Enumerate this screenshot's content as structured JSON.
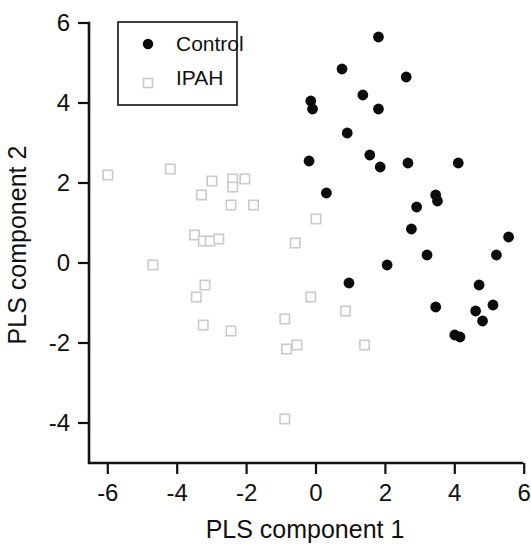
{
  "chart_data": {
    "type": "scatter",
    "title": "",
    "xlabel": "PLS component 1",
    "ylabel": "PLS component 2",
    "xlim": [
      -7,
      6
    ],
    "ylim": [
      -5,
      6
    ],
    "xticks": [
      -6,
      -4,
      -2,
      0,
      2,
      4,
      6
    ],
    "yticks": [
      -4,
      -2,
      0,
      2,
      4,
      6
    ],
    "xtick_labels": [
      "-6",
      "-4",
      "-2",
      "0",
      "2",
      "4",
      "6"
    ],
    "ytick_labels": [
      "-4",
      "-2",
      "0",
      "2",
      "4",
      "6"
    ],
    "grid": false,
    "legend_position": "top-left",
    "series": [
      {
        "name": "Control",
        "marker": "filled-circle",
        "color": "#0c0c0c",
        "points": [
          [
            1.8,
            5.65
          ],
          [
            0.75,
            4.85
          ],
          [
            2.6,
            4.65
          ],
          [
            1.35,
            4.2
          ],
          [
            -0.15,
            4.05
          ],
          [
            -0.1,
            3.85
          ],
          [
            1.8,
            3.85
          ],
          [
            0.9,
            3.25
          ],
          [
            1.55,
            2.7
          ],
          [
            -0.2,
            2.55
          ],
          [
            2.65,
            2.5
          ],
          [
            4.1,
            2.5
          ],
          [
            1.85,
            2.4
          ],
          [
            0.3,
            1.75
          ],
          [
            3.45,
            1.7
          ],
          [
            3.5,
            1.55
          ],
          [
            2.9,
            1.4
          ],
          [
            2.75,
            0.85
          ],
          [
            3.2,
            0.2
          ],
          [
            5.2,
            0.2
          ],
          [
            5.55,
            0.65
          ],
          [
            2.05,
            -0.05
          ],
          [
            0.95,
            -0.5
          ],
          [
            4.7,
            -0.55
          ],
          [
            3.45,
            -1.1
          ],
          [
            5.1,
            -1.05
          ],
          [
            4.6,
            -1.2
          ],
          [
            4.8,
            -1.45
          ],
          [
            4.0,
            -1.8
          ],
          [
            4.15,
            -1.85
          ]
        ]
      },
      {
        "name": "IPAH",
        "marker": "open-square",
        "color": "#c9c9cf",
        "points": [
          [
            -6.0,
            2.2
          ],
          [
            -4.2,
            2.35
          ],
          [
            -3.0,
            2.05
          ],
          [
            -2.4,
            2.1
          ],
          [
            -2.4,
            1.9
          ],
          [
            -2.05,
            2.1
          ],
          [
            -3.3,
            1.7
          ],
          [
            -2.45,
            1.45
          ],
          [
            -1.8,
            1.45
          ],
          [
            0.0,
            1.1
          ],
          [
            -3.5,
            0.7
          ],
          [
            -3.25,
            0.55
          ],
          [
            -3.05,
            0.55
          ],
          [
            -2.8,
            0.6
          ],
          [
            -0.6,
            0.5
          ],
          [
            -4.7,
            -0.05
          ],
          [
            -3.2,
            -0.55
          ],
          [
            -3.45,
            -0.85
          ],
          [
            -0.15,
            -0.85
          ],
          [
            0.85,
            -1.2
          ],
          [
            -3.25,
            -1.55
          ],
          [
            -2.45,
            -1.7
          ],
          [
            -0.9,
            -1.4
          ],
          [
            -0.85,
            -2.15
          ],
          [
            -0.55,
            -2.05
          ],
          [
            1.4,
            -2.05
          ],
          [
            -0.9,
            -3.9
          ]
        ]
      }
    ]
  },
  "legend": {
    "entries": [
      {
        "label": "Control",
        "marker": "filled-circle"
      },
      {
        "label": "IPAH",
        "marker": "open-square"
      }
    ]
  },
  "axes": {
    "x_title": "PLS component 1",
    "y_title": "PLS component 2"
  }
}
